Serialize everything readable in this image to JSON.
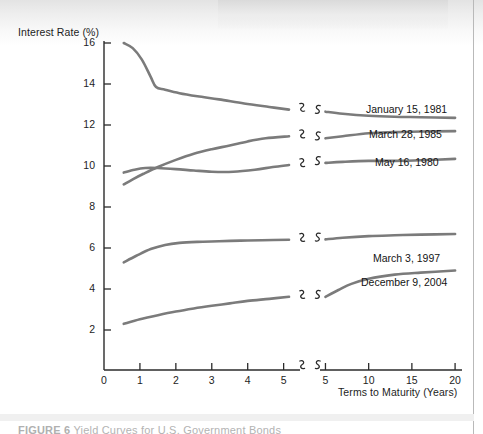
{
  "figure": {
    "caption_label": "FIGURE 6",
    "caption_text": "Yield Curves for U.S. Government Bonds"
  },
  "chart_data": {
    "type": "line",
    "title": "",
    "xlabel": "Terms to Maturity (Years)",
    "ylabel": "Interest Rate (%)",
    "ylim": [
      2,
      16
    ],
    "ytick_labels": [
      "16",
      "14",
      "12",
      "10",
      "8",
      "6",
      "4",
      "2"
    ],
    "ytick_values": [
      16,
      14,
      12,
      10,
      8,
      6,
      4,
      2
    ],
    "grid": false,
    "legend_position": "inline-right-of-curves",
    "axis_break": true,
    "panels": [
      {
        "name": "left-panel",
        "xlim": [
          0,
          5.4
        ],
        "xtick_labels": [
          "0",
          "1",
          "2",
          "3",
          "4",
          "5"
        ],
        "xtick_values": [
          0,
          1,
          2,
          3,
          4,
          5
        ]
      },
      {
        "name": "right-panel",
        "xlim": [
          4.6,
          20.8
        ],
        "xtick_labels": [
          "5",
          "10",
          "15",
          "20"
        ],
        "xtick_values": [
          5,
          10,
          15,
          20
        ]
      }
    ],
    "series": [
      {
        "name": "January 15, 1981",
        "label": "January 15, 1981",
        "color": "#7b7b7b",
        "left": {
          "x": [
            0.55,
            0.8,
            1.05,
            1.3,
            1.45,
            1.7,
            2.1,
            2.6,
            3.2,
            3.9,
            4.6,
            5.15
          ],
          "y": [
            16.0,
            15.75,
            15.2,
            14.35,
            13.85,
            13.72,
            13.55,
            13.4,
            13.25,
            13.05,
            12.88,
            12.75
          ]
        },
        "right": {
          "x": [
            5.0,
            7.0,
            10.0,
            13.0,
            16.0,
            20.0
          ],
          "y": [
            12.65,
            12.55,
            12.45,
            12.4,
            12.38,
            12.35
          ]
        }
      },
      {
        "name": "March 28, 1985",
        "label": "March 28, 1985",
        "color": "#7b7b7b",
        "left": {
          "x": [
            0.55,
            0.8,
            1.1,
            1.5,
            2.0,
            2.5,
            3.0,
            3.5,
            4.0,
            4.5,
            5.15
          ],
          "y": [
            9.1,
            9.35,
            9.62,
            9.95,
            10.3,
            10.6,
            10.82,
            11.0,
            11.2,
            11.35,
            11.45
          ]
        },
        "right": {
          "x": [
            5.0,
            7.0,
            10.0,
            13.0,
            16.0,
            20.0
          ],
          "y": [
            11.35,
            11.45,
            11.6,
            11.65,
            11.68,
            11.7
          ]
        }
      },
      {
        "name": "May 16, 1980",
        "label": "May 16, 1980",
        "color": "#7b7b7b",
        "left": {
          "x": [
            0.55,
            0.85,
            1.15,
            1.5,
            2.0,
            2.5,
            3.0,
            3.6,
            4.2,
            4.7,
            5.15
          ],
          "y": [
            9.68,
            9.82,
            9.9,
            9.9,
            9.85,
            9.78,
            9.72,
            9.72,
            9.82,
            9.95,
            10.05
          ]
        },
        "right": {
          "x": [
            5.0,
            7.0,
            10.0,
            13.0,
            16.0,
            20.0
          ],
          "y": [
            10.15,
            10.2,
            10.25,
            10.25,
            10.28,
            10.35
          ]
        }
      },
      {
        "name": "March 3, 1997",
        "label": "March 3, 1997",
        "color": "#7b7b7b",
        "left": {
          "x": [
            0.55,
            0.9,
            1.3,
            1.7,
            2.1,
            2.6,
            3.2,
            3.8,
            4.4,
            5.15
          ],
          "y": [
            5.3,
            5.62,
            5.95,
            6.15,
            6.25,
            6.3,
            6.33,
            6.36,
            6.38,
            6.4
          ]
        },
        "right": {
          "x": [
            5.0,
            7.0,
            10.0,
            13.0,
            16.0,
            20.0
          ],
          "y": [
            6.42,
            6.5,
            6.58,
            6.62,
            6.65,
            6.68
          ]
        }
      },
      {
        "name": "December 9, 2004",
        "label": "December 9, 2004",
        "color": "#7b7b7b",
        "left": {
          "x": [
            0.55,
            1.0,
            1.5,
            2.0,
            2.5,
            3.0,
            3.5,
            4.0,
            4.6,
            5.15
          ],
          "y": [
            2.3,
            2.52,
            2.72,
            2.9,
            3.05,
            3.18,
            3.3,
            3.42,
            3.52,
            3.62
          ]
        },
        "right": {
          "x": [
            5.0,
            6.5,
            8.0,
            10.0,
            13.0,
            16.0,
            20.0
          ],
          "y": [
            3.62,
            3.95,
            4.25,
            4.5,
            4.7,
            4.8,
            4.9
          ]
        }
      }
    ],
    "series_label_positions": [
      {
        "label": "January 15, 1981",
        "x": 366,
        "y": 103
      },
      {
        "label": "March 28, 1985",
        "x": 369,
        "y": 128
      },
      {
        "label": "May 16, 1980",
        "x": 375,
        "y": 156
      },
      {
        "label": "March 3, 1997",
        "x": 373,
        "y": 252
      },
      {
        "label": "December 9, 2004",
        "x": 361,
        "y": 276
      }
    ]
  }
}
